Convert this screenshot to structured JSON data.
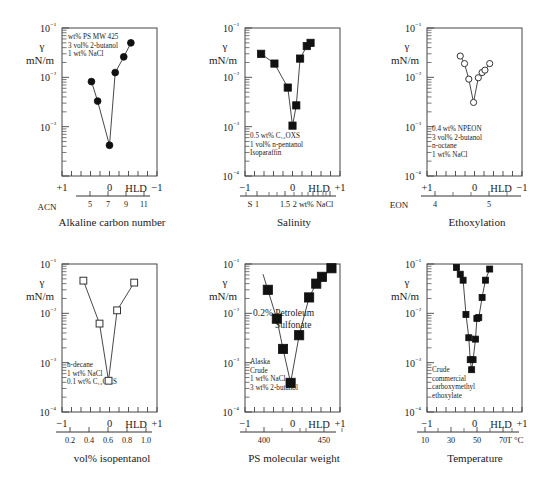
{
  "figure": {
    "axis_label_gamma": "γ",
    "axis_label_units": "mN/m",
    "hld_label": "HLD"
  },
  "chart_data": [
    {
      "type": "scatter",
      "title": "Alkaline carbon number",
      "xlabel": "HLD",
      "ylabel": "γ mN/m",
      "second_axis_name": "ACN",
      "xlim": [
        1,
        -1
      ],
      "ylim": [
        0.0001,
        0.1
      ],
      "yticks": [
        "10⁻¹",
        "10⁻²",
        "10⁻³"
      ],
      "xticks": [
        "+1",
        "0",
        "−1"
      ],
      "second_axis_ticks": [
        "5",
        "7",
        "9",
        "11"
      ],
      "annotations": [
        "wt% PS MW 425",
        "3 vol% 2-butanol",
        "1 wt% NaCl"
      ],
      "marker": "filled-circle",
      "x": [
        0.38,
        0.25,
        0.0,
        -0.12,
        -0.3,
        -0.45
      ],
      "y": [
        0.0082,
        0.0033,
        0.00042,
        0.0125,
        0.026,
        0.05
      ]
    },
    {
      "type": "scatter",
      "title": "Salinity",
      "xlabel": "HLD",
      "ylabel": "γ mN/m",
      "second_axis_name": "S",
      "xlim": [
        -1,
        1
      ],
      "ylim": [
        0.0001,
        0.1
      ],
      "yticks": [
        "10⁻¹",
        "10⁻²",
        "10⁻³",
        "10⁻⁴"
      ],
      "xticks": [
        "−1",
        "0",
        "+1"
      ],
      "second_axis_ticks": [
        "1",
        "1.5",
        "2 wt% NaCl"
      ],
      "annotations": [
        "0.5 wt% C₁₂OXS",
        "1 vol% n-pentanol",
        "Isoparaffin"
      ],
      "marker": "filled-square",
      "x": [
        -0.66,
        -0.38,
        -0.1,
        0.0,
        0.08,
        0.16,
        0.3,
        0.38
      ],
      "y": [
        0.03,
        0.019,
        0.0062,
        0.00105,
        0.0027,
        0.024,
        0.043,
        0.05
      ]
    },
    {
      "type": "scatter",
      "title": "Ethoxylation",
      "xlabel": "HLD",
      "ylabel": "γ mN/m",
      "second_axis_name": "EON",
      "xlim": [
        1,
        -1
      ],
      "ylim": [
        0.0001,
        0.1
      ],
      "yticks": [
        "10⁻¹",
        "10⁻²",
        "10⁻³",
        "10⁻⁴"
      ],
      "xticks": [
        "+1",
        "0",
        "−1"
      ],
      "second_axis_ticks": [
        "4",
        "5"
      ],
      "annotations": [
        "0.4 wt% NPEON",
        "3 vol% 2-butanol",
        "n-octane",
        "1 wt% NaCl"
      ],
      "marker": "open-circle",
      "x": [
        0.3,
        0.21,
        0.12,
        0.02,
        -0.08,
        -0.16,
        -0.22,
        -0.32
      ],
      "y": [
        0.027,
        0.019,
        0.0092,
        0.0031,
        0.0098,
        0.0125,
        0.014,
        0.019
      ]
    },
    {
      "type": "scatter",
      "title": "vol% isopentanol",
      "xlabel": "HLD",
      "ylabel": "γ mN/m",
      "second_axis_name": "",
      "xlim": [
        -1,
        1
      ],
      "ylim": [
        0.0001,
        0.1
      ],
      "yticks": [
        "10⁻¹",
        "10⁻²",
        "10⁻³",
        "10⁻⁴"
      ],
      "xticks": [
        "−1",
        "0",
        "+1"
      ],
      "second_axis_ticks": [
        "0.2",
        "0.4",
        "0.6",
        "0.8",
        "1.0"
      ],
      "annotations": [
        "n-decane",
        "1 wt% NaCl",
        "0.1 wt% C₁₂OXS"
      ],
      "marker": "open-square",
      "x": [
        -0.55,
        -0.21,
        -0.02,
        0.16,
        0.52
      ],
      "y": [
        0.046,
        0.0062,
        0.00043,
        0.0115,
        0.042
      ]
    },
    {
      "type": "scatter",
      "title": "PS molecular weight",
      "xlabel": "HLD",
      "ylabel": "γ mN/m",
      "second_axis_name": "",
      "xlim": [
        -1,
        1
      ],
      "ylim": [
        0.0001,
        0.1
      ],
      "yticks": [
        "10⁻¹",
        "10⁻²",
        "10⁻³",
        "10⁻⁴"
      ],
      "xticks": [
        "−1",
        "0",
        "+1"
      ],
      "second_axis_ticks": [
        "400",
        "450"
      ],
      "annotations": [
        "Alaska",
        "Crude",
        "1 wt% NaCl",
        "3 wt% 2-butanol"
      ],
      "big_annotations": [
        "0.2% Petroleum",
        "Sulfonate"
      ],
      "marker": "filled-square",
      "x": [
        -0.52,
        -0.33,
        -0.2,
        -0.04,
        0.14,
        0.35,
        0.5,
        0.62,
        0.82
      ],
      "y": [
        0.03,
        0.0078,
        0.0019,
        0.00039,
        0.0036,
        0.021,
        0.04,
        0.055,
        0.082
      ]
    },
    {
      "type": "scatter",
      "title": "Temperature",
      "xlabel": "HLD",
      "ylabel": "γ mN/m",
      "second_axis_name": "T °C",
      "xlim": [
        -1,
        1
      ],
      "ylim": [
        0.0001,
        0.1
      ],
      "yticks": [
        "10⁻¹",
        "10⁻²",
        "10⁻³",
        "10⁻⁴"
      ],
      "xticks": [
        "−1",
        "0",
        "+1"
      ],
      "second_axis_ticks": [
        "10",
        "30",
        "50",
        "70"
      ],
      "annotations": [
        "Crude",
        "commercial",
        "carboxymethyl",
        "ethoxylate"
      ],
      "marker": "filled-square",
      "x": [
        -0.38,
        -0.3,
        -0.24,
        -0.18,
        -0.12,
        -0.09,
        -0.06,
        -0.03,
        0.02,
        0.05,
        0.09,
        0.16,
        0.23,
        0.32
      ],
      "y": [
        0.085,
        0.062,
        0.047,
        0.0095,
        0.0032,
        0.00115,
        0.00072,
        0.00115,
        0.003,
        0.0079,
        0.0082,
        0.021,
        0.047,
        0.079
      ]
    }
  ]
}
